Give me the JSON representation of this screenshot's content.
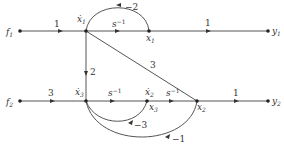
{
  "diagram": {
    "type": "signal-flow-graph",
    "nodes": [
      {
        "id": "f1",
        "label": "f",
        "sub": "1",
        "x": 20,
        "y": 31
      },
      {
        "id": "x1dot",
        "label": "ẋ",
        "sub": "1",
        "x": 86,
        "y": 31
      },
      {
        "id": "x1",
        "label": "x",
        "sub": "1",
        "x": 149,
        "y": 31
      },
      {
        "id": "y1",
        "label": "y",
        "sub": "1",
        "x": 268,
        "y": 31
      },
      {
        "id": "f2",
        "label": "f",
        "sub": "2",
        "x": 20,
        "y": 101
      },
      {
        "id": "x3dot",
        "label": "ẋ",
        "sub": "3",
        "x": 86,
        "y": 101
      },
      {
        "id": "x2dot_x3",
        "label": "ẋ",
        "sub": "2",
        "label2": "x",
        "sub2": "3",
        "x": 147,
        "y": 101
      },
      {
        "id": "x2",
        "label": "x",
        "sub": "2",
        "x": 197,
        "y": 101
      },
      {
        "id": "y2",
        "label": "y",
        "sub": "2",
        "x": 268,
        "y": 101
      }
    ],
    "edges": [
      {
        "from": "f1",
        "to": "x1dot",
        "gain": "1"
      },
      {
        "from": "x1dot",
        "to": "x1",
        "gain": "s",
        "gain_sup": "−1"
      },
      {
        "from": "x1",
        "to": "y1",
        "gain": "1"
      },
      {
        "from": "x1",
        "to": "x1dot",
        "gain": "−2"
      },
      {
        "from": "x1dot",
        "to": "x3dot",
        "gain": "2"
      },
      {
        "from": "x1dot",
        "to": "x2",
        "gain": "3"
      },
      {
        "from": "f2",
        "to": "x3dot",
        "gain": "3"
      },
      {
        "from": "x3dot",
        "to": "x2dot_x3",
        "gain": "s",
        "gain_sup": "−1"
      },
      {
        "from": "x2dot_x3",
        "to": "x2",
        "gain": "s",
        "gain_sup": "−1"
      },
      {
        "from": "x2",
        "to": "y2",
        "gain": "1"
      },
      {
        "from": "x2dot_x3",
        "to": "x3dot",
        "gain": "−3"
      },
      {
        "from": "x2",
        "to": "x3dot",
        "gain": "−1"
      }
    ]
  },
  "labels": {
    "f1": "f",
    "f1_sub": "1",
    "x1dot": "ẋ",
    "x1dot_sub": "1",
    "x1": "x",
    "x1_sub": "1",
    "y1": "y",
    "y1_sub": "1",
    "f2": "f",
    "f2_sub": "2",
    "x3dot": "ẋ",
    "x3dot_sub": "3",
    "x2dot": "ẋ",
    "x2dot_sub": "2",
    "x3": "x",
    "x3_sub": "3",
    "x2": "x",
    "x2_sub": "2",
    "y2": "y",
    "y2_sub": "2",
    "g_f1_x1dot": "1",
    "g_x1dot_x1": "s",
    "g_x1dot_x1_sup": "−1",
    "g_x1_y1": "1",
    "g_x1_x1dot": "−2",
    "g_x1dot_x3dot": "2",
    "g_x1dot_x2": "3",
    "g_f2_x3dot": "3",
    "g_x3dot_x2dot": "s",
    "g_x3dot_x2dot_sup": "−1",
    "g_x3_x2": "s",
    "g_x3_x2_sup": "−1",
    "g_x2_y2": "1",
    "g_x3_x3dot": "−3",
    "g_x2_x3dot": "−1"
  }
}
